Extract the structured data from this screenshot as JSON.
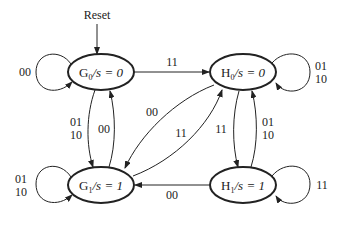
{
  "diagram": {
    "type": "state-diagram",
    "reset_label": "Reset",
    "states": [
      {
        "id": "G0",
        "name": "G",
        "sub": "0",
        "output": "/s = 0",
        "cx": 100,
        "cy": 72
      },
      {
        "id": "H0",
        "name": "H",
        "sub": "0",
        "output": "/s = 0",
        "cx": 243,
        "cy": 73
      },
      {
        "id": "G1",
        "name": "G",
        "sub": "1",
        "output": "/s = 1",
        "cx": 101,
        "cy": 185
      },
      {
        "id": "H1",
        "name": "H",
        "sub": "1",
        "output": "/s = 1",
        "cx": 243,
        "cy": 185
      }
    ],
    "transitions": [
      {
        "from": "G0",
        "to": "G0",
        "label": [
          "00"
        ]
      },
      {
        "from": "G0",
        "to": "H0",
        "label": [
          "11"
        ]
      },
      {
        "from": "G0",
        "to": "G1",
        "label": [
          "01",
          "10"
        ]
      },
      {
        "from": "G1",
        "to": "G0",
        "label": [
          "00"
        ]
      },
      {
        "from": "H0",
        "to": "H0",
        "label": [
          "01",
          "10"
        ]
      },
      {
        "from": "H0",
        "to": "G1",
        "label": [
          "00"
        ]
      },
      {
        "from": "G1",
        "to": "H0",
        "label": [
          "11"
        ]
      },
      {
        "from": "H0",
        "to": "H1",
        "label": [
          "11"
        ]
      },
      {
        "from": "H1",
        "to": "H0",
        "label": [
          "01",
          "10"
        ]
      },
      {
        "from": "G1",
        "to": "G1",
        "label": [
          "01",
          "10"
        ]
      },
      {
        "from": "H1",
        "to": "G1",
        "label": [
          "00"
        ]
      },
      {
        "from": "H1",
        "to": "H1",
        "label": [
          "11"
        ]
      }
    ],
    "labels": {
      "g0_self": "00",
      "g0_h0": "11",
      "g0_g1_a": "01",
      "g0_g1_b": "10",
      "g1_g0": "00",
      "h0_self_a": "01",
      "h0_self_b": "10",
      "h0_g1": "00",
      "g1_h0": "11",
      "h0_h1": "11",
      "h1_h0_a": "01",
      "h1_h0_b": "10",
      "g1_self_a": "01",
      "g1_self_b": "10",
      "h1_g1": "00",
      "h1_self": "11"
    },
    "state_text": {
      "g0_name": "G",
      "g0_sub": "0",
      "g0_out": "/s = 0",
      "h0_name": "H",
      "h0_sub": "0",
      "h0_out": "/s = 0",
      "g1_name": "G",
      "g1_sub": "1",
      "g1_out": "/s = 1",
      "h1_name": "H",
      "h1_sub": "1",
      "h1_out": "/s = 1"
    },
    "colors": {
      "stroke": "#222222",
      "background": "#ffffff"
    }
  }
}
